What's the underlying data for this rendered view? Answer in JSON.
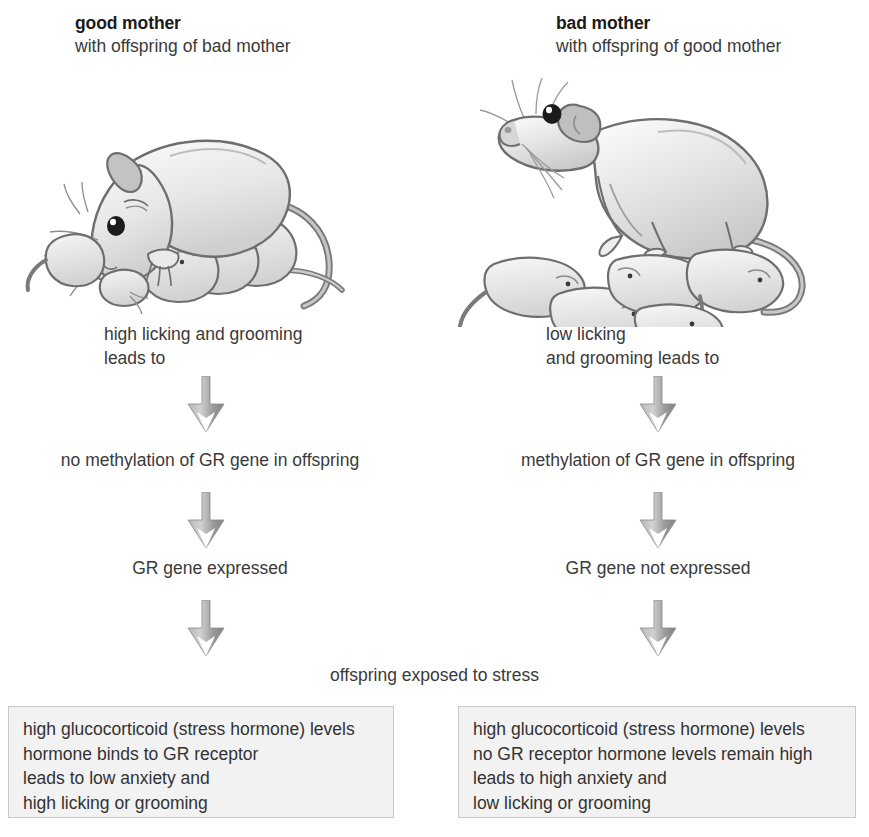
{
  "diagram": {
    "title_hidden": "Maternal care and GR gene methylation in rat offspring",
    "columns": [
      {
        "id": "left",
        "header_title": "good mother",
        "header_sub": "with offspring of bad mother",
        "behavior": "high licking and grooming\nleads to",
        "methylation": "no methylation of GR gene in offspring",
        "expression": "GR gene expressed",
        "outcome_lines": [
          "high glucocorticoid (stress hormone) levels",
          "hormone binds to GR receptor",
          "leads to low anxiety and",
          "high licking or grooming"
        ]
      },
      {
        "id": "right",
        "header_title": "bad mother",
        "header_sub": "with offspring of good mother",
        "behavior": "low licking\nand grooming leads to",
        "methylation": "methylation of GR gene in offspring",
        "expression": "GR gene not expressed",
        "outcome_lines": [
          "high glucocorticoid (stress hormone) levels",
          "no GR receptor hormone levels remain high",
          "leads to high anxiety and",
          "low licking or grooming"
        ]
      }
    ],
    "shared_step": "offspring exposed to stress",
    "icons": {
      "arrow": "down-arrow-icon",
      "left_illustration": "rat-mother-with-pups-illustration",
      "right_illustration": "rat-mother-standing-over-pups-illustration"
    },
    "colors": {
      "text": "#3a3a3a",
      "heading": "#1b1b1b",
      "arrow_light": "#c9c9c9",
      "arrow_mid": "#9a9a9a",
      "arrow_dark": "#7d7d7d",
      "box_fill": "#f2f2f2",
      "box_border": "#c8c8c8",
      "illustration_line": "#6e6e6e",
      "illustration_fill": "#d9d9d9"
    }
  }
}
